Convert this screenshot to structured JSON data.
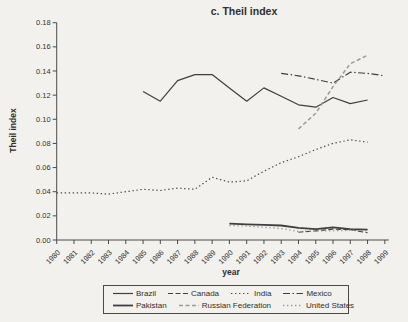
{
  "page": {
    "background": "#f2f1ed"
  },
  "chart_data": {
    "type": "line",
    "title": "c. Theil index",
    "xlabel": "year",
    "ylabel": "Theil index",
    "x_range": [
      1980,
      1999
    ],
    "x_tick_labels": [
      "1980",
      "1981",
      "1982",
      "1983",
      "1984",
      "1985",
      "1986",
      "1987",
      "1988",
      "1989",
      "1990",
      "1991",
      "1992",
      "1993",
      "1994",
      "1995",
      "1996",
      "1997",
      "1998",
      "1999"
    ],
    "ylim": [
      0,
      0.18
    ],
    "y_tick_step": 0.02,
    "grid": false,
    "legend_position": "bottom-center",
    "axis_color": "#4a4a4a",
    "legend_rows": [
      [
        "Brazil",
        "Canada",
        "India",
        "Mexico"
      ],
      [
        "Pakistan",
        "Russian Federation",
        "United States"
      ]
    ],
    "series": [
      {
        "name": "Brazil",
        "color": "#3f3f3f",
        "width": 1.2,
        "dash": "",
        "x": [
          1985,
          1986,
          1987,
          1988,
          1989,
          1990,
          1991,
          1992,
          1993,
          1994,
          1995,
          1996,
          1997,
          1998
        ],
        "values": [
          0.123,
          0.115,
          0.132,
          0.137,
          0.137,
          0.126,
          0.115,
          0.126,
          0.119,
          0.112,
          0.11,
          0.118,
          0.113,
          0.116
        ]
      },
      {
        "name": "Canada",
        "color": "#3f3f3f",
        "width": 1.1,
        "dash": "5,2.5",
        "x": [
          1994,
          1995,
          1996,
          1997,
          1998
        ],
        "values": [
          0.0065,
          0.0075,
          0.009,
          0.0085,
          0.006
        ]
      },
      {
        "name": "India",
        "color": "#4a4a4a",
        "width": 1.2,
        "dash": "1.4,2.6",
        "x": [
          1980,
          1981,
          1982,
          1983,
          1984,
          1985,
          1986,
          1987,
          1988,
          1989,
          1990,
          1991,
          1992,
          1993,
          1994,
          1995,
          1996,
          1997,
          1998
        ],
        "values": [
          0.039,
          0.039,
          0.039,
          0.038,
          0.04,
          0.042,
          0.041,
          0.043,
          0.042,
          0.052,
          0.048,
          0.049,
          0.057,
          0.064,
          0.069,
          0.075,
          0.08,
          0.083,
          0.081
        ]
      },
      {
        "name": "Mexico",
        "color": "#3f3f3f",
        "width": 1.2,
        "dash": "7,2.5,1.5,2.5",
        "x": [
          1993,
          1994,
          1995,
          1996,
          1997,
          1998,
          1999
        ],
        "values": [
          0.138,
          0.136,
          0.133,
          0.13,
          0.139,
          0.138,
          0.136
        ]
      },
      {
        "name": "Pakistan",
        "color": "#3f3f3f",
        "width": 1.8,
        "dash": "",
        "x": [
          1990,
          1991,
          1992,
          1993,
          1994,
          1995,
          1996,
          1997,
          1998
        ],
        "values": [
          0.0135,
          0.013,
          0.0125,
          0.012,
          0.01,
          0.009,
          0.0105,
          0.009,
          0.0085
        ]
      },
      {
        "name": "Russian Federation",
        "color": "#9b9b9b",
        "width": 1.5,
        "dash": "4,2.5",
        "x": [
          1994,
          1995,
          1996,
          1997,
          1998
        ],
        "values": [
          0.092,
          0.105,
          0.127,
          0.146,
          0.153
        ]
      },
      {
        "name": "United States",
        "color": "#9b9b9b",
        "width": 1.3,
        "dash": "1.4,2.6",
        "x": [
          1990,
          1991,
          1992,
          1993,
          1994,
          1995,
          1996,
          1997,
          1998
        ],
        "values": [
          0.012,
          0.0115,
          0.0105,
          0.0095,
          0.007,
          0.0075,
          0.0075,
          0.008,
          0.0075
        ]
      }
    ]
  }
}
